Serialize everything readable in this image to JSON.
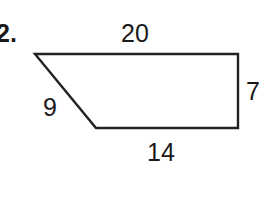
{
  "problem": {
    "number_label": "2.",
    "shape": "trapezoid",
    "sides": {
      "top": "20",
      "right": "7",
      "bottom": "14",
      "slant": "9"
    },
    "stroke_color": "#222222",
    "vertices": [
      [
        35,
        54
      ],
      [
        238,
        54
      ],
      [
        238,
        128
      ],
      [
        96,
        128
      ]
    ]
  }
}
